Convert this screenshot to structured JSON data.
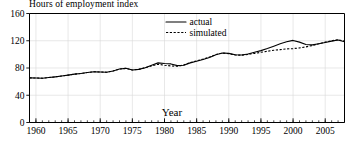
{
  "chart_data": {
    "type": "line",
    "title": "Hours of employment index",
    "xlabel": "Year",
    "ylabel": "",
    "xlim": [
      1959,
      2008
    ],
    "ylim": [
      0,
      160
    ],
    "yticks": [
      0,
      40,
      80,
      120,
      160
    ],
    "xticks": [
      1960,
      1965,
      1970,
      1975,
      1980,
      1985,
      1990,
      1995,
      2000,
      2005
    ],
    "xtick_labels": [
      "1960",
      "1965",
      "1970",
      "1975",
      "1980",
      "1985",
      "1990",
      "1995",
      "2000",
      "2005"
    ],
    "ytick_labels": [
      "0",
      "40",
      "80",
      "120",
      "160"
    ],
    "xtick_minor_interval": 1,
    "grid": true,
    "legend_position": "top-center",
    "legend": [
      {
        "name": "actual",
        "style": "solid"
      },
      {
        "name": "simulated",
        "style": "dashed"
      }
    ],
    "x": [
      1959,
      1960,
      1961,
      1962,
      1963,
      1964,
      1965,
      1966,
      1967,
      1968,
      1969,
      1970,
      1971,
      1972,
      1973,
      1974,
      1975,
      1976,
      1977,
      1978,
      1979,
      1980,
      1981,
      1982,
      1983,
      1984,
      1985,
      1986,
      1987,
      1988,
      1989,
      1990,
      1991,
      1992,
      1993,
      1994,
      1995,
      1996,
      1997,
      1998,
      1999,
      2000,
      2001,
      2002,
      2003,
      2004,
      2005,
      2006,
      2007,
      2008
    ],
    "series": [
      {
        "name": "actual",
        "style": "solid",
        "values": [
          65.5,
          65.3,
          65.0,
          66.0,
          67.0,
          68.2,
          69.5,
          71.0,
          72.0,
          73.3,
          74.5,
          74.2,
          73.8,
          75.5,
          78.5,
          79.5,
          77.0,
          78.0,
          80.5,
          84.0,
          87.5,
          86.5,
          86.0,
          83.5,
          84.0,
          87.5,
          90.0,
          92.5,
          95.5,
          99.5,
          102.0,
          101.5,
          99.5,
          99.0,
          100.5,
          103.0,
          105.5,
          108.5,
          112.0,
          115.5,
          118.5,
          120.5,
          118.0,
          114.5,
          114.0,
          115.5,
          117.5,
          119.5,
          121.0,
          118.5
        ]
      },
      {
        "name": "simulated",
        "style": "dashed",
        "values": [
          65.5,
          65.3,
          65.0,
          66.0,
          67.0,
          68.2,
          69.5,
          71.0,
          72.0,
          73.3,
          74.5,
          74.2,
          73.8,
          75.5,
          78.5,
          79.5,
          77.0,
          78.0,
          80.5,
          83.0,
          85.5,
          84.0,
          83.0,
          82.5,
          84.5,
          88.0,
          90.5,
          93.0,
          96.0,
          99.8,
          102.0,
          101.0,
          99.0,
          98.8,
          100.0,
          101.5,
          103.0,
          104.5,
          106.0,
          107.0,
          108.0,
          108.5,
          109.5,
          111.0,
          113.0,
          115.5,
          118.0,
          120.0,
          121.5,
          119.5
        ]
      }
    ]
  }
}
